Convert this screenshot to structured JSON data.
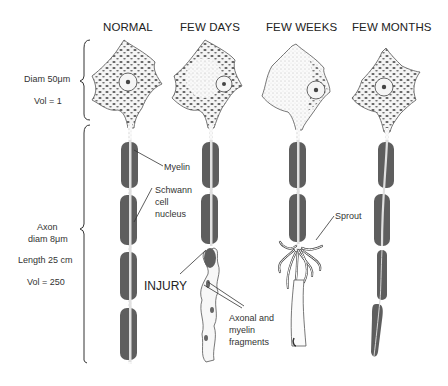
{
  "figure": {
    "columns": [
      {
        "label": "NORMAL"
      },
      {
        "label": "FEW DAYS"
      },
      {
        "label": "FEW WEEKS"
      },
      {
        "label": "FEW MONTHS"
      }
    ],
    "left_annotations": {
      "cell_body": {
        "diameter": "Diam 50μm",
        "volume": "Vol = 1"
      },
      "axon": {
        "line1": "Axon",
        "line2": "diam 8μm",
        "length": "Length 25 cm",
        "volume": "Vol = 250"
      }
    },
    "callouts": {
      "myelin": "Myelin",
      "schwann_1": "Schwann",
      "schwann_2": "cell",
      "schwann_3": "nucleus",
      "injury": "INJURY",
      "fragments_1": "Axonal and",
      "fragments_2": "myelin",
      "fragments_3": "fragments",
      "sprout": "Sprout"
    },
    "colors": {
      "myelin": "#5e5e5e",
      "axon_stipple": "#e8e8e8",
      "outline": "#444444",
      "text": "#222222"
    }
  }
}
